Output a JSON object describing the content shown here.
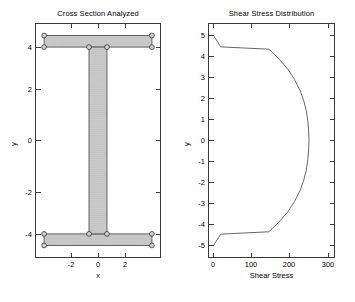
{
  "figure": {
    "width": 355,
    "height": 302,
    "background": "#ffffff",
    "axis_color": "#3a3a3a",
    "mesh_fill": "#c9c9c9",
    "mesh_line": "#8a8a8a",
    "curve_color": "#555555"
  },
  "chart_data": [
    {
      "type": "diagram",
      "title": "Cross Section Analyzed",
      "xlabel": "x",
      "ylabel": "y",
      "xlim": [
        -3.45,
        3.45
      ],
      "ylim": [
        -5.55,
        5.55
      ],
      "xticks": [
        -2,
        0,
        2
      ],
      "xticklabels": [
        "-2",
        "0",
        "2"
      ],
      "yticks": [
        4,
        2,
        0,
        -2,
        -4
      ],
      "yticklabels": [
        "4",
        "2",
        "0",
        "-2",
        "-4"
      ],
      "grid": false,
      "legend": "none",
      "shape": "I-beam",
      "geometry": {
        "flange_width": 6.0,
        "flange_half_width": 3.0,
        "flange_thickness": 0.55,
        "web_thickness": 1.0,
        "web_half_thickness": 0.5,
        "total_height": 10.0,
        "top_flange_y": [
          4.45,
          5.0
        ],
        "bottom_flange_y": [
          -5.0,
          -4.45
        ],
        "web_y": [
          -4.45,
          4.45
        ]
      },
      "nodes": [
        {
          "x": -3.0,
          "y": 5.0
        },
        {
          "x": 3.0,
          "y": 5.0
        },
        {
          "x": -3.0,
          "y": 4.45
        },
        {
          "x": -0.5,
          "y": 4.45
        },
        {
          "x": 0.5,
          "y": 4.45
        },
        {
          "x": 3.0,
          "y": 4.45
        },
        {
          "x": -3.0,
          "y": -4.45
        },
        {
          "x": -0.5,
          "y": -4.45
        },
        {
          "x": 0.5,
          "y": -4.45
        },
        {
          "x": 3.0,
          "y": -4.45
        },
        {
          "x": -3.0,
          "y": -5.0
        },
        {
          "x": 3.0,
          "y": -5.0
        }
      ]
    },
    {
      "type": "line",
      "title": "Shear Stress Distribution",
      "xlabel": "Shear Stress",
      "ylabel": "y",
      "xlim": [
        -12,
        318
      ],
      "ylim": [
        -5.55,
        5.55
      ],
      "xticks": [
        0,
        100,
        200,
        300
      ],
      "xticklabels": [
        "0",
        "100",
        "200",
        "300"
      ],
      "yticks": [
        5,
        4,
        3,
        2,
        1,
        0,
        -1,
        -2,
        -3,
        -4,
        -5
      ],
      "yticklabels": [
        "5",
        "4",
        "3",
        "2",
        "1",
        "0",
        "-1",
        "-2",
        "-3",
        "-4",
        "-5"
      ],
      "grid": false,
      "legend": "none",
      "series": [
        {
          "name": "shear stress",
          "points": [
            [
              0,
              5.0
            ],
            [
              19,
              4.46
            ],
            [
              146,
              4.35
            ],
            [
              172,
              3.9
            ],
            [
              196,
              3.4
            ],
            [
              214,
              2.9
            ],
            [
              228,
              2.4
            ],
            [
              238,
              1.9
            ],
            [
              245,
              1.4
            ],
            [
              249,
              0.9
            ],
            [
              251,
              0.45
            ],
            [
              252,
              0.0
            ],
            [
              251,
              -0.45
            ],
            [
              249,
              -0.9
            ],
            [
              245,
              -1.4
            ],
            [
              238,
              -1.9
            ],
            [
              228,
              -2.4
            ],
            [
              214,
              -2.9
            ],
            [
              196,
              -3.4
            ],
            [
              172,
              -3.9
            ],
            [
              146,
              -4.35
            ],
            [
              19,
              -4.46
            ],
            [
              0,
              -5.0
            ]
          ]
        }
      ]
    }
  ]
}
